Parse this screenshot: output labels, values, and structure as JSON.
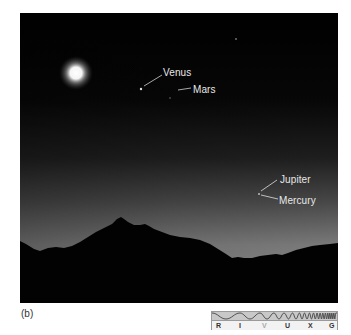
{
  "figure": {
    "panel_label": "(b)",
    "sky_colors": {
      "top": "#000000",
      "horizon_left": "#6a6a6a",
      "horizon_right": "#8c8c8c"
    },
    "moon": {
      "x": 56,
      "y": 60,
      "core_color": "#ffffff",
      "glow_color": "#c8c8c8"
    },
    "labels": [
      {
        "id": "venus",
        "text": "Venus",
        "x": 143,
        "y": 54
      },
      {
        "id": "mars",
        "text": "Mars",
        "x": 173,
        "y": 71
      },
      {
        "id": "jupiter",
        "text": "Jupiter",
        "x": 260,
        "y": 161
      },
      {
        "id": "mercury",
        "text": "Mercury",
        "x": 259,
        "y": 182
      }
    ]
  },
  "spectrum_bar": {
    "letters": [
      {
        "text": "R",
        "x": 4,
        "active": false
      },
      {
        "text": "I",
        "x": 27,
        "active": false
      },
      {
        "text": "V",
        "x": 50,
        "active": true
      },
      {
        "text": "U",
        "x": 73,
        "active": false
      },
      {
        "text": "X",
        "x": 96,
        "active": false
      },
      {
        "text": "G",
        "x": 117,
        "active": false
      }
    ],
    "highlighted_band": "V"
  }
}
